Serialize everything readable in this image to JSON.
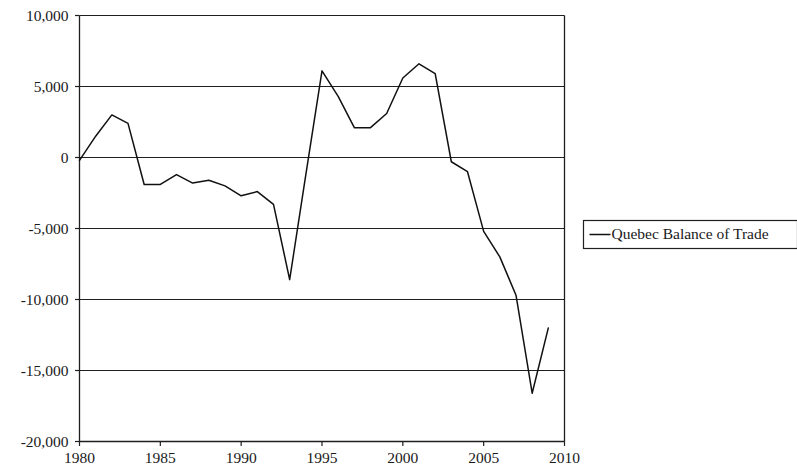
{
  "chart_data": {
    "type": "line",
    "title": "",
    "subtitle": "",
    "xlabel": "",
    "ylabel": "",
    "xlim": [
      1980,
      2010
    ],
    "ylim": [
      -20000,
      10000
    ],
    "grid": true,
    "legend_position": "right",
    "x_ticks": [
      1980,
      1985,
      1990,
      1995,
      2000,
      2005,
      2010
    ],
    "x_tick_labels": [
      "1980",
      "1985",
      "1990",
      "1995",
      "2000",
      "2005",
      "2010"
    ],
    "y_ticks": [
      10000,
      5000,
      0,
      -5000,
      -10000,
      -15000,
      -20000
    ],
    "y_tick_labels": [
      "10,000",
      "5,000",
      "0",
      "-5,000",
      "-10,000",
      "-15,000",
      "-20,000"
    ],
    "legend": [
      "Quebec Balance of Trade"
    ],
    "series": [
      {
        "name": "Quebec Balance of Trade",
        "color": "#111111",
        "x": [
          1980,
          1981,
          1982,
          1983,
          1984,
          1985,
          1986,
          1987,
          1988,
          1989,
          1990,
          1991,
          1992,
          1993,
          1994,
          1995,
          1996,
          1997,
          1998,
          1999,
          2000,
          2001,
          2002,
          2003,
          2004,
          2005,
          2006,
          2007,
          2008,
          2009
        ],
        "values": [
          -200,
          1500,
          3000,
          2400,
          -1900,
          -1900,
          -1200,
          -1800,
          -1600,
          -2000,
          -2700,
          -2400,
          -3300,
          -8600,
          -1200,
          6100,
          4300,
          2100,
          2100,
          3100,
          5600,
          6600,
          5900,
          -300,
          -1000,
          -5200,
          -7000,
          -9700,
          -16600,
          -12000
        ]
      }
    ]
  },
  "legend": {
    "entries": [
      {
        "label": "Quebec Balance of Trade"
      }
    ]
  }
}
